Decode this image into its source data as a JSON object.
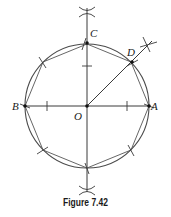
{
  "figure": {
    "caption": "Figure 7.42",
    "labels": {
      "A": "A",
      "B": "B",
      "C": "C",
      "D": "D",
      "O": "O"
    },
    "colors": {
      "stroke": "#3a3a3a",
      "point": "#111111",
      "background": "#ffffff"
    }
  }
}
